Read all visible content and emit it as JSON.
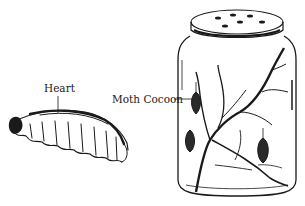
{
  "figure": {
    "labels": {
      "heart": "Heart",
      "moth_cocoon": "Moth Cocoon"
    },
    "objects": [
      "caterpillar-larva",
      "glass-jar-with-branches-and-cocoons"
    ],
    "colors": {
      "ink": "#1a1a1a",
      "background": "#ffffff"
    }
  }
}
